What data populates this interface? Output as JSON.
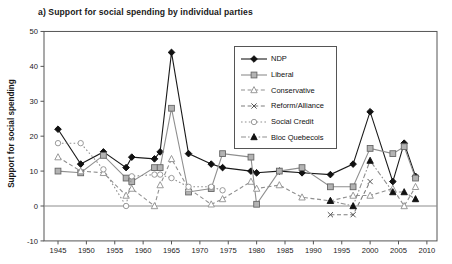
{
  "chart_data": {
    "type": "line",
    "title": "a) Support for social spending by individual parties",
    "ylabel": "Support for social spending",
    "xlabel": "",
    "ylim": [
      -10,
      50
    ],
    "yticks": [
      50,
      40,
      30,
      20,
      10,
      0,
      -10
    ],
    "xticks": [
      1945,
      1950,
      1955,
      1960,
      1965,
      1970,
      1975,
      1980,
      1985,
      1990,
      1995,
      2000,
      2005,
      2010
    ],
    "zero_line": true,
    "grid": false,
    "legend_position": "upper-center-right",
    "frame_color": "#555555",
    "series": [
      {
        "name": "NDP",
        "marker": "diamond-filled",
        "line_style": "solid",
        "color": "#1a1a1a",
        "marker_fill": "#111111",
        "points": [
          [
            1945,
            22
          ],
          [
            1949,
            12
          ],
          [
            1953,
            15.5
          ],
          [
            1957,
            11
          ],
          [
            1958,
            14
          ],
          [
            1962,
            13.5
          ],
          [
            1963,
            15.5
          ],
          [
            1965,
            44
          ],
          [
            1968,
            15
          ],
          [
            1972,
            12
          ],
          [
            1974,
            11
          ],
          [
            1979,
            10
          ],
          [
            1980,
            9.5
          ],
          [
            1984,
            10
          ],
          [
            1988,
            9.5
          ],
          [
            1993,
            9
          ],
          [
            1997,
            12
          ],
          [
            2000,
            27
          ],
          [
            2004,
            7
          ],
          [
            2006,
            18
          ],
          [
            2008,
            8.5
          ]
        ]
      },
      {
        "name": "Liberal",
        "marker": "square-filled",
        "line_style": "solid",
        "color": "#8f8f8f",
        "marker_fill": "#b3b3b3",
        "points": [
          [
            1945,
            10
          ],
          [
            1949,
            9.5
          ],
          [
            1953,
            14.5
          ],
          [
            1957,
            8
          ],
          [
            1958,
            7
          ],
          [
            1962,
            11
          ],
          [
            1963,
            11
          ],
          [
            1965,
            28
          ],
          [
            1968,
            4
          ],
          [
            1972,
            5
          ],
          [
            1974,
            15
          ],
          [
            1979,
            14
          ],
          [
            1980,
            0.5
          ],
          [
            1984,
            10
          ],
          [
            1988,
            11
          ],
          [
            1993,
            5.5
          ],
          [
            1997,
            5.5
          ],
          [
            2000,
            16.5
          ],
          [
            2004,
            15
          ],
          [
            2006,
            17
          ],
          [
            2008,
            8
          ]
        ]
      },
      {
        "name": "Conservative",
        "marker": "triangle-open",
        "line_style": "dashed",
        "color": "#8f8f8f",
        "marker_fill": "#ffffff",
        "points": [
          [
            1945,
            14
          ],
          [
            1949,
            10
          ],
          [
            1953,
            9.5
          ],
          [
            1957,
            3
          ],
          [
            1958,
            5
          ],
          [
            1962,
            0
          ],
          [
            1963,
            6
          ],
          [
            1965,
            13.5
          ],
          [
            1968,
            5
          ],
          [
            1972,
            0.5
          ],
          [
            1974,
            2
          ],
          [
            1979,
            7
          ],
          [
            1980,
            5
          ],
          [
            1984,
            6
          ],
          [
            1988,
            2.5
          ],
          [
            1993,
            1.5
          ],
          [
            1997,
            3
          ],
          [
            2000,
            3
          ],
          [
            2004,
            5
          ],
          [
            2006,
            0
          ],
          [
            2008,
            5.5
          ]
        ]
      },
      {
        "name": "Reform/Alliance",
        "marker": "x",
        "line_style": "dashed",
        "color": "#7d7d7d",
        "marker_fill": "#555555",
        "points": [
          [
            1993,
            -2.5
          ],
          [
            1997,
            -2.5
          ],
          [
            2000,
            7
          ]
        ]
      },
      {
        "name": "Social Credit",
        "marker": "circle-open",
        "line_style": "dotted",
        "color": "#8f8f8f",
        "marker_fill": "#ffffff",
        "points": [
          [
            1945,
            18
          ],
          [
            1949,
            18
          ],
          [
            1953,
            10.5
          ],
          [
            1957,
            0
          ],
          [
            1958,
            8.5
          ],
          [
            1962,
            9
          ],
          [
            1963,
            9
          ],
          [
            1965,
            8
          ],
          [
            1968,
            5.5
          ],
          [
            1972,
            5.5
          ],
          [
            1974,
            4.5
          ]
        ]
      },
      {
        "name": "Bloc Quebecois",
        "marker": "triangle-filled",
        "line_style": "dash-dot",
        "color": "#8f8f8f",
        "marker_fill": "#111111",
        "points": [
          [
            1993,
            1.5
          ],
          [
            1997,
            0
          ],
          [
            2000,
            13
          ],
          [
            2004,
            4
          ],
          [
            2006,
            4
          ],
          [
            2008,
            2
          ]
        ]
      }
    ]
  }
}
